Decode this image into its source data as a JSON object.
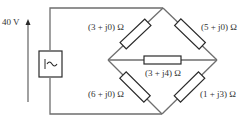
{
  "source": {
    "voltage_label": "40 V",
    "symbol": "ac-source-icon"
  },
  "impedances": {
    "top_left": "(3 + j0) Ω",
    "top_right": "(5 + j0) Ω",
    "middle": "(3 + j4) Ω",
    "bottom_left": "(6 + j0) Ω",
    "bottom_right": "(1 + j3) Ω"
  },
  "colors": {
    "wire": "#6e6e6e",
    "component": "#2a2a2a",
    "text": "#333333",
    "background": "#ffffff"
  }
}
